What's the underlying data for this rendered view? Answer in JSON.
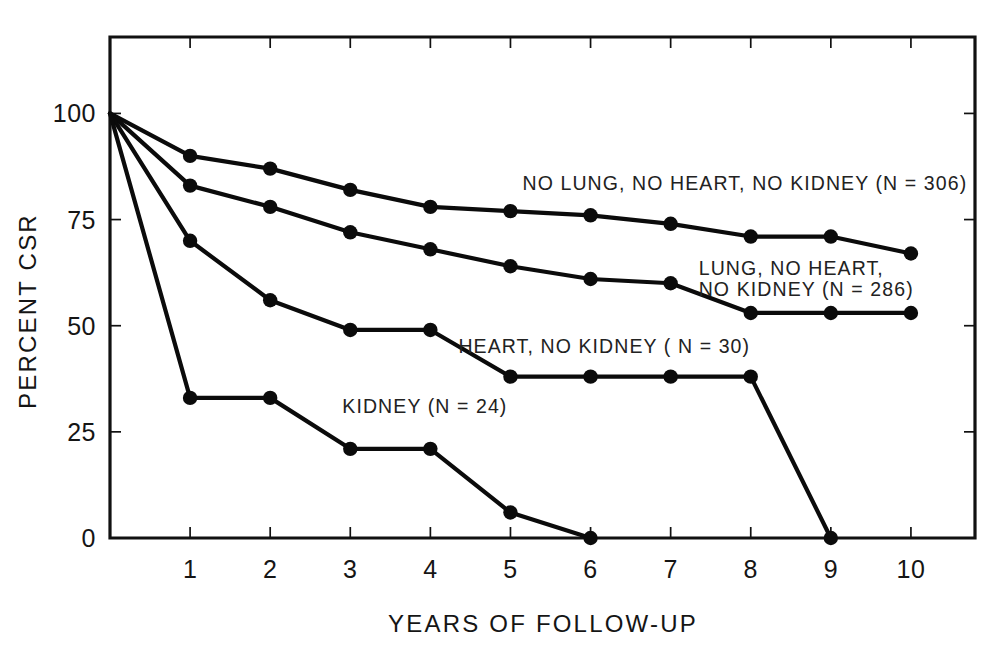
{
  "figure": {
    "background_color": "#ffffff",
    "ink_color": "#111111"
  },
  "chart_data": {
    "type": "line",
    "title": "",
    "subtitle": "",
    "xlabel": "YEARS OF FOLLOW-UP",
    "ylabel": "PERCENT CSR",
    "xlim": [
      0,
      10.8
    ],
    "ylim": [
      0,
      118
    ],
    "grid": false,
    "legend": "inline-annotations",
    "x": [
      0,
      1,
      2,
      3,
      4,
      5,
      6,
      7,
      8,
      9,
      10
    ],
    "xticks": [
      "1",
      "2",
      "3",
      "4",
      "5",
      "6",
      "7",
      "8",
      "9",
      "10"
    ],
    "xtick_values": [
      1,
      2,
      3,
      4,
      5,
      6,
      7,
      8,
      9,
      10
    ],
    "yticks": [
      "0",
      "25",
      "50",
      "75",
      "100"
    ],
    "ytick_values": [
      0,
      25,
      50,
      75,
      100
    ],
    "series": [
      {
        "name": "NO LUNG, NO HEART, NO KIDNEY",
        "n": 306,
        "label": "NO LUNG, NO HEART, NO KIDNEY  (N = 306)",
        "x": [
          0,
          1,
          2,
          3,
          4,
          5,
          6,
          7,
          8,
          9,
          10
        ],
        "values": [
          100,
          90,
          87,
          82,
          78,
          77,
          76,
          74,
          71,
          71,
          67
        ]
      },
      {
        "name": "LUNG, NO HEART, NO KIDNEY",
        "n": 286,
        "label_line1": "LUNG, NO HEART,",
        "label_line2": "NO KIDNEY  (N = 286)",
        "x": [
          0,
          1,
          2,
          3,
          4,
          5,
          6,
          7,
          8,
          9,
          10
        ],
        "values": [
          100,
          83,
          78,
          72,
          68,
          64,
          61,
          60,
          53,
          53,
          53
        ]
      },
      {
        "name": "HEART, NO KIDNEY",
        "n": 30,
        "label": "HEART, NO KIDNEY  ( N = 30)",
        "x": [
          0,
          1,
          2,
          3,
          4,
          5,
          6,
          7,
          8,
          9
        ],
        "values": [
          100,
          70,
          56,
          49,
          49,
          38,
          38,
          38,
          38,
          0
        ]
      },
      {
        "name": "KIDNEY",
        "n": 24,
        "label": "KIDNEY  (N = 24)",
        "x": [
          0,
          1,
          2,
          3,
          4,
          5,
          6
        ],
        "values": [
          100,
          33,
          33,
          21,
          21,
          6,
          0
        ]
      }
    ],
    "annotations": [
      {
        "text": "NO LUNG, NO HEART, NO KIDNEY  (N = 306)",
        "x": 5.15,
        "y": 82
      },
      {
        "text": "LUNG, NO HEART,",
        "x": 7.35,
        "y": 62
      },
      {
        "text": "NO KIDNEY  (N = 286)",
        "x": 7.35,
        "y": 57
      },
      {
        "text": "HEART, NO KIDNEY  ( N = 30)",
        "x": 4.35,
        "y": 43.5
      },
      {
        "text": "KIDNEY  (N = 24)",
        "x": 2.9,
        "y": 29.5
      }
    ]
  }
}
